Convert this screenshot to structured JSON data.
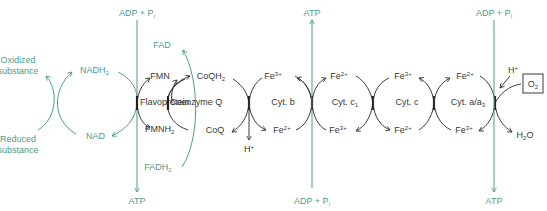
{
  "colors": {
    "accent_green": "#4f9b8c",
    "text_dark": "#3a3a3a"
  },
  "labels": {
    "oxidized_substance": [
      "Oxidized",
      "substance"
    ],
    "reduced_substance": [
      "Reduced",
      "substance"
    ],
    "nadh2": {
      "base": "NADH",
      "sub": "2"
    },
    "nad": "NAD",
    "fad": "FAD",
    "fadh2": {
      "base": "FADH",
      "sub": "2"
    },
    "fmn": "FMN",
    "fmnh2": {
      "base": "FMNH",
      "sub": "2"
    },
    "flavoprotein": "Flavoprotein",
    "coqh2": {
      "base": "CoQH",
      "sub": "2"
    },
    "coq": "CoQ",
    "coenzyme_q": "Coenzyme Q",
    "h_plus_1": {
      "base": "H",
      "sup": "+"
    },
    "cyt_b": "Cyt. b",
    "cyt_c1": {
      "base": "Cyt. c",
      "sub": "1"
    },
    "cyt_c": "Cyt. c",
    "cyt_aa3": {
      "base": "Cyt. a/a",
      "sub": "3"
    },
    "fe3_plus": {
      "base": "Fe",
      "sup": "3+"
    },
    "fe2_plus": {
      "base": "Fe",
      "sup": "2+"
    },
    "h_plus_2": {
      "base": "H",
      "sup": "+"
    },
    "o2": {
      "base": "O",
      "sub": "2"
    },
    "h2o": {
      "pre": "H",
      "sub": "2",
      "post": "O"
    },
    "adp_pi": {
      "base": "ADP + P",
      "sub": "i"
    },
    "atp": "ATP"
  },
  "phosphorylation_sites": [
    {
      "top": "ADP + Pi",
      "bottom": "ATP",
      "direction": "down"
    },
    {
      "top": "ATP",
      "bottom": "ADP + Pi",
      "direction": "up"
    },
    {
      "top": "ADP + Pi",
      "bottom": "ATP",
      "direction": "down"
    }
  ]
}
